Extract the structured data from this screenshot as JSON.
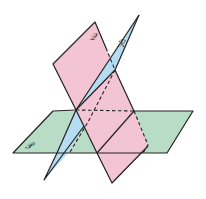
{
  "diagram": {
    "planes": [
      {
        "id": "P",
        "label": "𝒫",
        "color": "#b8dcc6",
        "orientation": "horizontal"
      },
      {
        "id": "Q",
        "label": "𝒬",
        "color": "#f3c5d4",
        "orientation": "vertical"
      },
      {
        "id": "R",
        "label": "ℛ",
        "color": "#b6dcf1",
        "orientation": "oblique"
      }
    ],
    "labels": {
      "P": "𝒫",
      "Q": "𝒬",
      "R": "ℛ"
    },
    "line_styles": {
      "visible": "solid",
      "hidden": "dashed"
    },
    "colors": {
      "stroke": "#222222",
      "background": "#ffffff"
    }
  }
}
